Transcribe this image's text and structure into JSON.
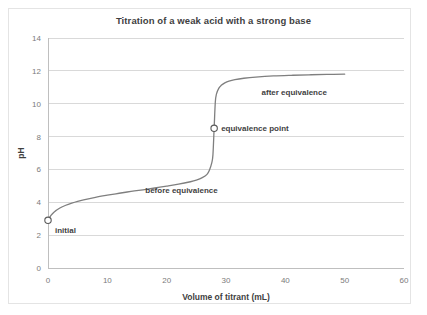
{
  "chart_data": {
    "type": "line",
    "title": "Titration of a weak acid with a strong base",
    "xlabel": "Volume of titrant (mL)",
    "ylabel": "pH",
    "xlim": [
      0,
      60
    ],
    "ylim": [
      0,
      14
    ],
    "xticks": [
      "0",
      "10",
      "20",
      "30",
      "40",
      "50",
      "60"
    ],
    "xtick_values": [
      0,
      10,
      20,
      30,
      40,
      50,
      60
    ],
    "yticks": [
      "0",
      "2",
      "4",
      "6",
      "8",
      "10",
      "12",
      "14"
    ],
    "ytick_values": [
      0,
      2,
      4,
      6,
      8,
      10,
      12,
      14
    ],
    "grid": "horizontal",
    "legend": "none",
    "series": [
      {
        "name": "titration curve",
        "color": "#7f7f7f",
        "x": [
          0,
          0.5,
          1,
          2,
          3,
          4,
          5,
          6,
          8,
          10,
          12,
          14,
          16,
          18,
          20,
          22,
          24,
          25,
          26,
          26.8,
          27.2,
          27.6,
          27.8,
          28,
          28.2,
          28.4,
          28.8,
          29.2,
          29.8,
          30.5,
          31.5,
          33,
          35,
          38,
          41,
          44,
          47,
          50
        ],
        "y": [
          2.9,
          3.2,
          3.4,
          3.65,
          3.82,
          3.95,
          4.06,
          4.15,
          4.3,
          4.43,
          4.55,
          4.66,
          4.76,
          4.87,
          4.98,
          5.1,
          5.25,
          5.35,
          5.5,
          5.7,
          5.95,
          6.4,
          6.9,
          8.5,
          10.1,
          10.6,
          10.95,
          11.12,
          11.27,
          11.38,
          11.47,
          11.55,
          11.62,
          11.69,
          11.73,
          11.76,
          11.78,
          11.8
        ]
      }
    ],
    "markers": [
      {
        "label": "initial",
        "x": 0,
        "y": 2.9
      },
      {
        "label": "equivalence point",
        "x": 28,
        "y": 8.5
      }
    ],
    "annotations": [
      {
        "label": "before equivalence",
        "x": 22.5,
        "y": 4.55
      },
      {
        "label": "after equivalence",
        "x": 41.5,
        "y": 10.55
      }
    ],
    "colors": {
      "curve": "#7f7f7f",
      "gridline": "#d9d9d9",
      "axis": "#bfbfbf",
      "title_text": "#3f3f3f",
      "tick_text": "#7b7b7b"
    }
  }
}
